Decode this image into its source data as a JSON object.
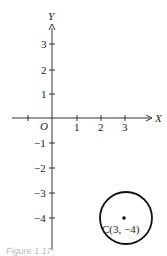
{
  "figure": {
    "caption": "Figure 1.17",
    "x_axis_label": "X",
    "y_axis_label": "Y",
    "origin_label": "O",
    "x_ticks": [
      {
        "value": -1,
        "label": ""
      },
      {
        "value": 1,
        "label": "1"
      },
      {
        "value": 2,
        "label": "2"
      },
      {
        "value": 3,
        "label": "3"
      }
    ],
    "y_ticks": [
      {
        "value": 3,
        "label": "3"
      },
      {
        "value": 2,
        "label": "2"
      },
      {
        "value": 1,
        "label": "1"
      },
      {
        "value": -1,
        "label": "−1"
      },
      {
        "value": -2,
        "label": "−2"
      },
      {
        "value": -3,
        "label": "−3"
      },
      {
        "value": -4,
        "label": "−4"
      }
    ],
    "circle": {
      "center_label": "C(3, −4)",
      "center": [
        3,
        -4
      ],
      "radius": 1
    }
  }
}
